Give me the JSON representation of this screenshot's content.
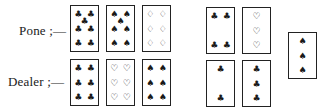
{
  "labels": {
    "pone": "Pone ;—",
    "dealer": "Dealer ;—"
  },
  "suit_glyphs": {
    "clubs": "♣",
    "spades": "♠",
    "hearts": "♡",
    "diamonds": "♢"
  },
  "hands": {
    "pone": [
      {
        "rank": "7",
        "suit": "clubs"
      },
      {
        "rank": "7",
        "suit": "spades"
      },
      {
        "rank": "6",
        "suit": "diamonds"
      }
    ],
    "dealer": [
      {
        "rank": "6",
        "suit": "clubs"
      },
      {
        "rank": "6",
        "suit": "hearts"
      },
      {
        "rank": "6",
        "suit": "spades"
      }
    ]
  },
  "crib_cards": {
    "pone": [
      {
        "rank": "4",
        "suit": "clubs"
      },
      {
        "rank": "3",
        "suit": "hearts"
      }
    ],
    "dealer": [
      {
        "rank": "2",
        "suit": "clubs"
      },
      {
        "rank": "3",
        "suit": "clubs"
      }
    ]
  },
  "starter": {
    "rank": "3",
    "suit": "spades"
  }
}
